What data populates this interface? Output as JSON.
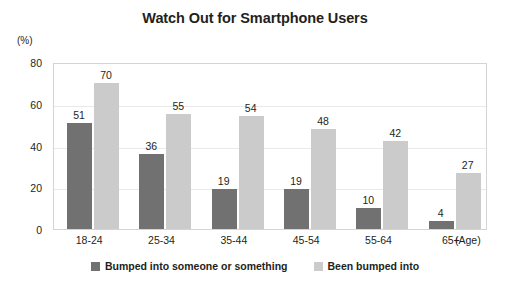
{
  "chart_data": {
    "type": "bar",
    "title": "Watch Out for Smartphone Users",
    "xlabel": "(Age)",
    "ylabel": "(%)",
    "categories": [
      "18-24",
      "25-34",
      "35-44",
      "45-54",
      "55-64",
      "65+"
    ],
    "series": [
      {
        "name": "Bumped into someone or something",
        "color": "#717171",
        "values": [
          51,
          36,
          19,
          19,
          10,
          4
        ]
      },
      {
        "name": "Been bumped into",
        "color": "#cbcbcb",
        "values": [
          70,
          55,
          54,
          48,
          42,
          27
        ]
      }
    ],
    "ylim": [
      0,
      80
    ],
    "yticks": [
      0,
      20,
      40,
      60,
      80
    ],
    "ytick_labels": [
      "0",
      "20",
      "40",
      "60",
      "80"
    ],
    "grid": true,
    "legend_position": "bottom",
    "data_labels": true
  },
  "legend": {
    "items": [
      {
        "label": "Bumped into someone or something",
        "color": "#717171"
      },
      {
        "label": "Been bumped into",
        "color": "#cbcbcb"
      }
    ]
  }
}
